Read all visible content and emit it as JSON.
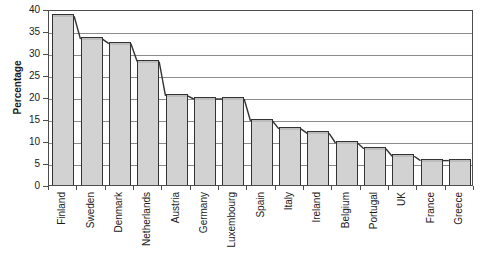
{
  "chart_data": {
    "type": "bar",
    "title": "",
    "subtitle": "",
    "xlabel": "",
    "ylabel": "Percentage",
    "ylim": [
      0,
      40
    ],
    "ytick_step": 5,
    "yticks": [
      "0",
      "5",
      "10",
      "15",
      "20",
      "25",
      "30",
      "35",
      "40"
    ],
    "grid": true,
    "legend": "none",
    "bar_color": "#d2d2d2",
    "bar_edge_color": "#333333",
    "gridline_color": "#8c8c8c",
    "axis_color": "#4d4d4d",
    "categories": [
      "Finland",
      "Sweden",
      "Denmark",
      "Netherlands",
      "Austria",
      "Germany",
      "Luxembourg",
      "Spain",
      "Italy",
      "Ireland",
      "Belgium",
      "Portugal",
      "UK",
      "France",
      "Greece"
    ],
    "values": [
      38.8,
      33.6,
      32.6,
      28.5,
      20.7,
      20,
      20,
      15,
      13.2,
      12.2,
      10,
      8.7,
      7,
      6,
      6
    ]
  }
}
